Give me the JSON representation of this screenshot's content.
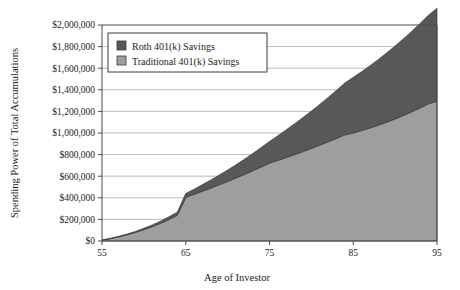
{
  "chart_data": {
    "type": "area",
    "stacked": true,
    "title": "",
    "xlabel": "Age of Investor",
    "ylabel": "Spending Power of Total Accumulations",
    "x": [
      55,
      56,
      57,
      58,
      59,
      60,
      61,
      62,
      63,
      64,
      65,
      66,
      67,
      68,
      69,
      70,
      71,
      72,
      73,
      74,
      75,
      76,
      77,
      78,
      79,
      80,
      81,
      82,
      83,
      84,
      85,
      86,
      87,
      88,
      89,
      90,
      91,
      92,
      93,
      94,
      95
    ],
    "xlim": [
      55,
      95
    ],
    "ylim": [
      0,
      2000000
    ],
    "xticks": [
      55,
      65,
      75,
      85,
      95
    ],
    "xtick_labels": [
      "55",
      "65",
      "75",
      "85",
      "95"
    ],
    "yticks": [
      0,
      200000,
      400000,
      600000,
      800000,
      1000000,
      1200000,
      1400000,
      1600000,
      1800000,
      2000000
    ],
    "ytick_labels": [
      "$0",
      "$200,000",
      "$400,000",
      "$600,000",
      "$800,000",
      "$1,000,000",
      "$1,200,000",
      "$1,400,000",
      "$1,600,000",
      "$1,800,000",
      "$2,000,000"
    ],
    "grid": true,
    "grid_axis": "y",
    "legend_position": "upper-left-inside",
    "series": [
      {
        "name": "Traditional 401(k) Savings",
        "color": "#9e9e9e",
        "values": [
          8000,
          22000,
          39000,
          58000,
          80000,
          105000,
          133000,
          164000,
          199000,
          238000,
          404000,
          432000,
          461000,
          490000,
          520000,
          551000,
          583000,
          616000,
          650000,
          685000,
          721000,
          747000,
          773000,
          800000,
          828000,
          857000,
          887000,
          918000,
          950000,
          983000,
          1000000,
          1022000,
          1046000,
          1072000,
          1100000,
          1130000,
          1162000,
          1196000,
          1232000,
          1270000,
          1295000
        ]
      },
      {
        "name": "Roth 401(k) Savings",
        "color": "#585858",
        "values": [
          1000,
          2000,
          4000,
          6000,
          9000,
          12000,
          16000,
          20000,
          25000,
          30000,
          36000,
          48000,
          61000,
          75000,
          90000,
          106000,
          123000,
          141000,
          160000,
          180000,
          201000,
          228000,
          256000,
          285000,
          315000,
          346000,
          378000,
          411000,
          445000,
          480000,
          516000,
          546000,
          577000,
          609000,
          642000,
          676000,
          711000,
          747000,
          784000,
          822000,
          860000
        ]
      }
    ],
    "totals": [
      9000,
      24000,
      43000,
      64000,
      89000,
      117000,
      149000,
      184000,
      224000,
      268000,
      440000,
      480000,
      522000,
      565000,
      610000,
      657000,
      706000,
      757000,
      810000,
      865000,
      922000,
      975000,
      1029000,
      1085000,
      1143000,
      1203000,
      1265000,
      1329000,
      1395000,
      1463000,
      1516000,
      1568000,
      1623000,
      1681000,
      1742000,
      1806000,
      1873000,
      1943000,
      2016000,
      2092000,
      2155000
    ]
  },
  "legend": {
    "items": [
      {
        "label": "Roth 401(k) Savings",
        "color": "#585858"
      },
      {
        "label": "Traditional 401(k) Savings",
        "color": "#9e9e9e"
      }
    ]
  }
}
